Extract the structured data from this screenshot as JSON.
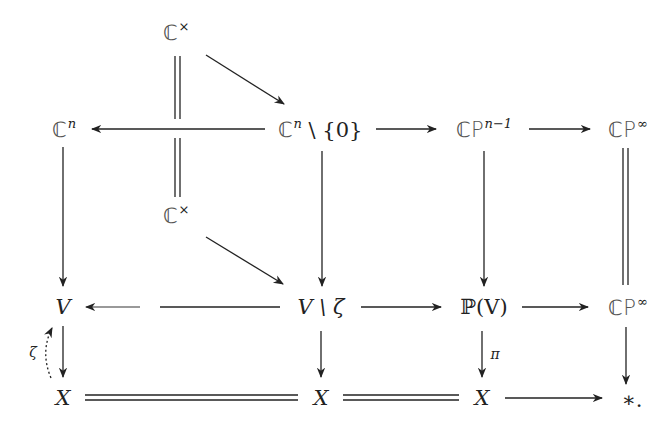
{
  "diagram": {
    "type": "commutative-diagram",
    "nodes": {
      "cstar_top": {
        "base": "ℂ",
        "sup": "×"
      },
      "cstar_mid": {
        "base": "ℂ",
        "sup": "×"
      },
      "cn": {
        "base": "ℂ",
        "sup": "n"
      },
      "cn_minus_0": {
        "base": "ℂ",
        "sup": "n",
        "rest": " \\ {0}"
      },
      "cpn1": {
        "base": "ℂP",
        "sup": "n−1"
      },
      "cpinf_top": {
        "base": "ℂP",
        "sup": "∞"
      },
      "v": {
        "text": "V"
      },
      "v_minus_zeta": {
        "text": "V \\ ζ"
      },
      "pv": {
        "text": "ℙ(V)"
      },
      "cpinf_mid": {
        "base": "ℂP",
        "sup": "∞"
      },
      "x1": {
        "text": "X"
      },
      "x2": {
        "text": "X"
      },
      "x3": {
        "text": "X"
      },
      "point": {
        "text": "∗."
      }
    },
    "labels": {
      "zeta": "ζ",
      "pi": "π"
    },
    "edges": [
      {
        "from": "cstar_top",
        "to": "cn_minus_0",
        "style": "arrow"
      },
      {
        "from": "cstar_top",
        "to": "cstar_mid",
        "style": "equals"
      },
      {
        "from": "cn_minus_0",
        "to": "cn",
        "style": "arrow"
      },
      {
        "from": "cn_minus_0",
        "to": "cpn1",
        "style": "arrow"
      },
      {
        "from": "cpn1",
        "to": "cpinf_top",
        "style": "arrow"
      },
      {
        "from": "cn",
        "to": "v",
        "style": "arrow"
      },
      {
        "from": "cn_minus_0",
        "to": "v_minus_zeta",
        "style": "arrow"
      },
      {
        "from": "cpn1",
        "to": "pv",
        "style": "arrow"
      },
      {
        "from": "cpinf_top",
        "to": "cpinf_mid",
        "style": "equals"
      },
      {
        "from": "cstar_mid",
        "to": "v_minus_zeta",
        "style": "arrow"
      },
      {
        "from": "v_minus_zeta",
        "to": "v",
        "style": "arrow"
      },
      {
        "from": "v_minus_zeta",
        "to": "pv",
        "style": "arrow"
      },
      {
        "from": "pv",
        "to": "cpinf_mid",
        "style": "arrow"
      },
      {
        "from": "v",
        "to": "x1",
        "style": "arrow"
      },
      {
        "from": "x1",
        "to": "v",
        "style": "dotted-curved-arrow",
        "label": "ζ"
      },
      {
        "from": "v_minus_zeta",
        "to": "x2",
        "style": "arrow"
      },
      {
        "from": "pv",
        "to": "x3",
        "style": "arrow",
        "label": "π"
      },
      {
        "from": "cpinf_mid",
        "to": "point",
        "style": "arrow"
      },
      {
        "from": "x1",
        "to": "x2",
        "style": "equals"
      },
      {
        "from": "x2",
        "to": "x3",
        "style": "equals"
      },
      {
        "from": "x3",
        "to": "point",
        "style": "arrow"
      }
    ]
  }
}
